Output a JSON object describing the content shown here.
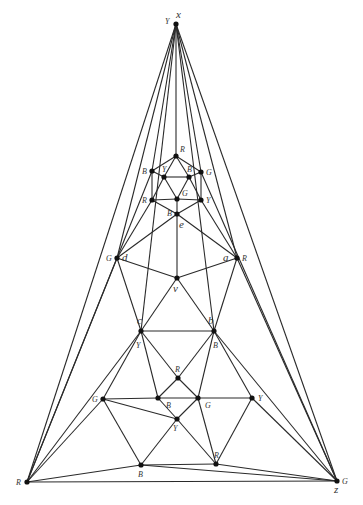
{
  "diagram": {
    "vertices": [
      {
        "id": "x",
        "x": 176,
        "y": 24,
        "color": "Y",
        "name": "x",
        "color_label_pos": [
          -11,
          0
        ],
        "name_pos": [
          0,
          -6
        ]
      },
      {
        "id": "Rc",
        "x": 27,
        "y": 482,
        "color": "R",
        "name": "",
        "color_label_pos": [
          -11,
          3
        ]
      },
      {
        "id": "z",
        "x": 337,
        "y": 481,
        "color": "G",
        "name": "z",
        "color_label_pos": [
          5,
          3
        ],
        "name_pos": [
          -3,
          12
        ]
      },
      {
        "id": "h1",
        "x": 176,
        "y": 156,
        "color": "R",
        "name": "",
        "color_label_pos": [
          4,
          -4
        ]
      },
      {
        "id": "h2",
        "x": 152,
        "y": 171,
        "color": "B",
        "name": "",
        "color_label_pos": [
          -10,
          3
        ]
      },
      {
        "id": "h3",
        "x": 201,
        "y": 172,
        "color": "G",
        "name": "",
        "color_label_pos": [
          5,
          3
        ]
      },
      {
        "id": "h4",
        "x": 164,
        "y": 177,
        "color": "Y",
        "name": "",
        "color_label_pos": [
          -2,
          -5
        ]
      },
      {
        "id": "h5",
        "x": 189,
        "y": 177,
        "color": "B",
        "name": "",
        "color_label_pos": [
          -2,
          -5
        ]
      },
      {
        "id": "h6",
        "x": 152,
        "y": 200,
        "color": "R",
        "name": "",
        "color_label_pos": [
          -10,
          3
        ]
      },
      {
        "id": "h7",
        "x": 177,
        "y": 199,
        "color": "G",
        "name": "",
        "color_label_pos": [
          5,
          -3
        ]
      },
      {
        "id": "h8",
        "x": 201,
        "y": 200,
        "color": "Y",
        "name": "",
        "color_label_pos": [
          5,
          3
        ]
      },
      {
        "id": "e",
        "x": 177,
        "y": 214,
        "color": "B",
        "name": "e",
        "color_label_pos": [
          -10,
          2
        ],
        "name_pos": [
          2,
          14
        ]
      },
      {
        "id": "d",
        "x": 117,
        "y": 258,
        "color": "G",
        "name": "d",
        "color_label_pos": [
          -11,
          3
        ],
        "name_pos": [
          5,
          3
        ]
      },
      {
        "id": "a",
        "x": 237,
        "y": 258,
        "color": "R",
        "name": "a",
        "color_label_pos": [
          5,
          3
        ],
        "name_pos": [
          -14,
          3
        ]
      },
      {
        "id": "v",
        "x": 177,
        "y": 278,
        "color": "",
        "name": "v",
        "name_pos": [
          -4,
          14
        ]
      },
      {
        "id": "c",
        "x": 141,
        "y": 331,
        "color": "Y",
        "name": "c",
        "color_label_pos": [
          -5,
          17
        ],
        "name_pos": [
          -4,
          -7
        ]
      },
      {
        "id": "b",
        "x": 214,
        "y": 331,
        "color": "B",
        "name": "b",
        "color_label_pos": [
          -1,
          17
        ],
        "name_pos": [
          -6,
          -7
        ]
      },
      {
        "id": "m1",
        "x": 178,
        "y": 378,
        "color": "R",
        "name": "",
        "color_label_pos": [
          -3,
          -6
        ]
      },
      {
        "id": "g1",
        "x": 103,
        "y": 399,
        "color": "G",
        "name": "",
        "color_label_pos": [
          -11,
          3
        ]
      },
      {
        "id": "g2",
        "x": 158,
        "y": 398,
        "color": "B",
        "name": "",
        "color_label_pos": [
          8,
          10
        ]
      },
      {
        "id": "g3",
        "x": 198,
        "y": 398,
        "color": "G",
        "name": "",
        "color_label_pos": [
          7,
          10
        ]
      },
      {
        "id": "g4",
        "x": 252,
        "y": 398,
        "color": "Y",
        "name": "",
        "color_label_pos": [
          6,
          3
        ]
      },
      {
        "id": "y1",
        "x": 177,
        "y": 419,
        "color": "Y",
        "name": "",
        "color_label_pos": [
          -4,
          12
        ]
      },
      {
        "id": "b1",
        "x": 141,
        "y": 465,
        "color": "B",
        "name": "",
        "color_label_pos": [
          -3,
          12
        ]
      },
      {
        "id": "r1",
        "x": 216,
        "y": 464,
        "color": "R",
        "name": "",
        "color_label_pos": [
          -2,
          -6
        ]
      }
    ],
    "edges": [
      [
        "x",
        "Rc"
      ],
      [
        "x",
        "z"
      ],
      [
        "x",
        "d"
      ],
      [
        "x",
        "a"
      ],
      [
        "x",
        "h1"
      ],
      [
        "x",
        "h2"
      ],
      [
        "x",
        "h3"
      ],
      [
        "x",
        "c"
      ],
      [
        "x",
        "b"
      ],
      [
        "Rc",
        "z"
      ],
      [
        "Rc",
        "d"
      ],
      [
        "Rc",
        "c"
      ],
      [
        "Rc",
        "g1"
      ],
      [
        "Rc",
        "b1"
      ],
      [
        "Rc",
        "h2"
      ],
      [
        "z",
        "a"
      ],
      [
        "z",
        "b"
      ],
      [
        "z",
        "g4"
      ],
      [
        "z",
        "r1"
      ],
      [
        "z",
        "b1"
      ],
      [
        "z",
        "h3"
      ],
      [
        "h1",
        "h2"
      ],
      [
        "h1",
        "h3"
      ],
      [
        "h1",
        "h4"
      ],
      [
        "h1",
        "h5"
      ],
      [
        "h2",
        "h4"
      ],
      [
        "h2",
        "h6"
      ],
      [
        "h3",
        "h5"
      ],
      [
        "h3",
        "h8"
      ],
      [
        "h4",
        "h5"
      ],
      [
        "h4",
        "h6"
      ],
      [
        "h4",
        "h7"
      ],
      [
        "h5",
        "h7"
      ],
      [
        "h5",
        "h8"
      ],
      [
        "h6",
        "h7"
      ],
      [
        "h7",
        "h8"
      ],
      [
        "h6",
        "e"
      ],
      [
        "h7",
        "e"
      ],
      [
        "h8",
        "e"
      ],
      [
        "h6",
        "d"
      ],
      [
        "h8",
        "a"
      ],
      [
        "e",
        "d"
      ],
      [
        "e",
        "a"
      ],
      [
        "e",
        "v"
      ],
      [
        "d",
        "v"
      ],
      [
        "a",
        "v"
      ],
      [
        "d",
        "c"
      ],
      [
        "a",
        "b"
      ],
      [
        "v",
        "c"
      ],
      [
        "v",
        "b"
      ],
      [
        "c",
        "b"
      ],
      [
        "c",
        "m1"
      ],
      [
        "b",
        "m1"
      ],
      [
        "c",
        "g2"
      ],
      [
        "b",
        "g3"
      ],
      [
        "c",
        "g1"
      ],
      [
        "b",
        "g4"
      ],
      [
        "m1",
        "g2"
      ],
      [
        "m1",
        "g3"
      ],
      [
        "g1",
        "g2"
      ],
      [
        "g2",
        "g3"
      ],
      [
        "g3",
        "g4"
      ],
      [
        "g1",
        "y1"
      ],
      [
        "g2",
        "y1"
      ],
      [
        "g3",
        "y1"
      ],
      [
        "g3",
        "r1"
      ],
      [
        "g1",
        "b1"
      ],
      [
        "y1",
        "b1"
      ],
      [
        "y1",
        "r1"
      ],
      [
        "g4",
        "r1"
      ],
      [
        "b1",
        "r1"
      ]
    ]
  }
}
